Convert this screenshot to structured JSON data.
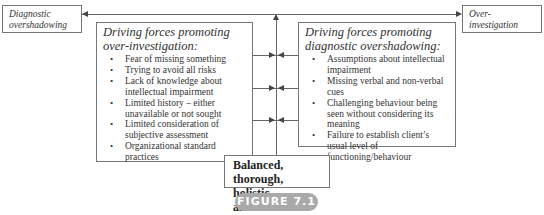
{
  "diagram": {
    "left_outcome": "Diagnostic overshadowing",
    "right_outcome": "Over-investigation",
    "left_box": {
      "title": "Driving forces promoting over-investigation:",
      "items": [
        "Fear of missing something",
        "Trying to avoid all risks",
        "Lack of knowledge about intellectual impairment",
        "Limited history – either unavailable or not sought",
        "Limited consideration of subjective assessment",
        "Organizational standard practices"
      ]
    },
    "right_box": {
      "title": "Driving forces promoting diagnostic overshadowing:",
      "items": [
        "Assumptions about intellectual impairment",
        "Missing verbal and non-verbal cues",
        "Challenging behaviour being seen without considering its meaning",
        "Failure to establish client’s usual level of functioning/behaviour"
      ]
    },
    "center": "Balanced, thorough, holistic assessment",
    "figure_label": "FIGURE 7.1"
  },
  "colors": {
    "line": "#666666",
    "border": "#777777",
    "badge": "#a9a9a9",
    "badge_text": "#ffffff"
  }
}
